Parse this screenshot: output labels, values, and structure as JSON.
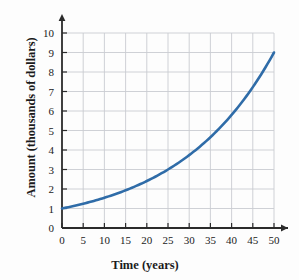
{
  "chart_data": {
    "type": "line",
    "title": "",
    "xlabel": "Time (years)",
    "ylabel": "Amount (thousands of dollars)",
    "xlim": [
      0,
      52
    ],
    "ylim": [
      0,
      10.5
    ],
    "xticks": [
      "0",
      "5",
      "10",
      "15",
      "20",
      "25",
      "30",
      "35",
      "40",
      "45",
      "50"
    ],
    "yticks": [
      "0",
      "1",
      "2",
      "3",
      "4",
      "5",
      "6",
      "7",
      "8",
      "9",
      "10"
    ],
    "grid": true,
    "legend": "none",
    "series": [
      {
        "name": "Amount",
        "color": "#2f6ca8",
        "x": [
          0,
          5,
          10,
          15,
          20,
          25,
          30,
          35,
          40,
          45,
          50
        ],
        "values": [
          1.0,
          1.25,
          1.55,
          1.93,
          2.41,
          3.0,
          3.74,
          4.66,
          5.8,
          7.23,
          9.0
        ]
      }
    ]
  },
  "axis": {
    "x_title": "Time (years)",
    "y_title": "Amount (thousands of dollars)"
  },
  "colors": {
    "curve": "#2f6ca8",
    "axis": "#2b2b2b",
    "grid": "#c9ccd1",
    "background": "#fdfdfd"
  }
}
